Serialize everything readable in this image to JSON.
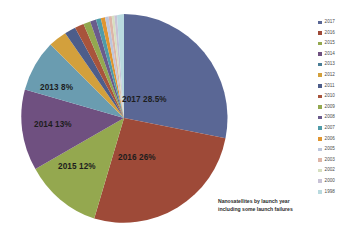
{
  "chart_data": {
    "type": "pie",
    "title": "Nanosatellites by launch year including some launch failures",
    "categories": [
      "2017",
      "2016",
      "2015",
      "2014",
      "2013",
      "2012",
      "2011",
      "2010",
      "2009",
      "2008",
      "2007",
      "2006",
      "2005",
      "2003",
      "2002",
      "2000",
      "1998"
    ],
    "values": [
      28.5,
      26,
      12,
      13,
      8,
      3.2,
      2.0,
      1.6,
      1.2,
      1.0,
      0.8,
      0.6,
      0.5,
      0.4,
      0.3,
      0.25,
      0.2
    ],
    "labeled_slices": [
      {
        "label": "2017  28.5%",
        "year": "2017",
        "percent": 28.5,
        "color": "#5a6795"
      },
      {
        "label": "2016  26%",
        "year": "2016",
        "percent": 26,
        "color": "#9e4a38"
      },
      {
        "label": "2015  12%",
        "year": "2015",
        "percent": 12,
        "color": "#94a84f"
      },
      {
        "label": "2014  13%",
        "year": "2014",
        "percent": 13,
        "color": "#6f5080"
      },
      {
        "label": "2013  8%",
        "year": "2013",
        "percent": 8,
        "color": "#6a9cb0"
      }
    ],
    "legend_position": "right",
    "grid": false,
    "xlabel": "",
    "ylabel": ""
  },
  "legend": {
    "items": [
      {
        "label": "2017",
        "color": "#5a6795"
      },
      {
        "label": "2016",
        "color": "#9e4a38"
      },
      {
        "label": "2015",
        "color": "#94a84f"
      },
      {
        "label": "2014",
        "color": "#6f5080"
      },
      {
        "label": "2013",
        "color": "#4a7d96"
      },
      {
        "label": "2012",
        "color": "#d3a03c"
      },
      {
        "label": "2011",
        "color": "#4d5d8a"
      },
      {
        "label": "2010",
        "color": "#a8543c"
      },
      {
        "label": "2009",
        "color": "#93a84f"
      },
      {
        "label": "2008",
        "color": "#6a5b8c"
      },
      {
        "label": "2007",
        "color": "#4f9ba8"
      },
      {
        "label": "2006",
        "color": "#e0952f"
      },
      {
        "label": "2005",
        "color": "#bdc6dc"
      },
      {
        "label": "2003",
        "color": "#ddb5a8"
      },
      {
        "label": "2002",
        "color": "#d6dfc0"
      },
      {
        "label": "2000",
        "color": "#c8c2d6"
      },
      {
        "label": "1998",
        "color": "#b9dadf"
      }
    ]
  },
  "caption": {
    "line1": "Nanosatellites by launch year",
    "line2": "including some launch failures"
  },
  "slice_labels": {
    "y2017": "2017  28.5%",
    "y2016": "2016  26%",
    "y2015": "2015  12%",
    "y2014": "2014  13%",
    "y2013": "2013  8%"
  }
}
